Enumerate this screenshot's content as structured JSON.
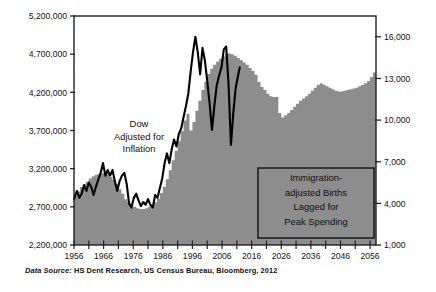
{
  "figure": {
    "background": "#ffffff",
    "plot_background": "#ffffff",
    "frame_color": "#222222",
    "area_color": "#8d8d8d",
    "line_color": "#000000"
  },
  "source": {
    "lead": "Data Source:",
    "text": " HS Dent Research, US Census Bureau, Bloomberg, 2012"
  },
  "annotations": {
    "dow": {
      "lines": [
        "Dow",
        "Adjusted for",
        "Inflation"
      ],
      "x": 139,
      "y": 127
    },
    "births": {
      "lines": [
        "Immigration-",
        "adjusted Births",
        "Lagged for",
        "Peak Spending"
      ],
      "x": 316,
      "y": 181,
      "box": {
        "x": 258,
        "y": 168,
        "width": 116,
        "height": 70
      }
    }
  },
  "chart_data": {
    "type": "area",
    "title": "",
    "xlabel": "",
    "ylabel": "",
    "grid": false,
    "legend": "none",
    "xlim": [
      1956,
      2058
    ],
    "x_ticks": [
      1956,
      1966,
      1976,
      1986,
      1996,
      2006,
      2016,
      2026,
      2036,
      2046,
      2056
    ],
    "x_minor_step": 5,
    "left_axis": {
      "name": "Immigration-adjusted Births Lagged for Peak Spending",
      "ylim": [
        2200000,
        5200000
      ],
      "ticks": [
        2200000,
        2700000,
        3200000,
        3700000,
        4200000,
        4700000,
        5200000
      ],
      "tick_labels": [
        "2,200,000",
        "2,700,000",
        "3,200,000",
        "3,700,000",
        "4,200,000",
        "4,700,000",
        "5,200,000"
      ]
    },
    "right_axis": {
      "name": "Dow Adjusted for Inflation",
      "ylim": [
        1000,
        17500
      ],
      "ticks": [
        1000,
        4000,
        7000,
        10000,
        13000,
        16000
      ],
      "tick_labels": [
        "1,000",
        "4,000",
        "7,000",
        "10,000",
        "13,000",
        "16,000"
      ]
    },
    "series": [
      {
        "name": "Immigration-adjusted Births Lagged for Peak Spending",
        "type": "area",
        "axis": "left",
        "color": "#8d8d8d",
        "x": [
          1956,
          1957,
          1958,
          1959,
          1960,
          1961,
          1962,
          1963,
          1964,
          1965,
          1966,
          1967,
          1968,
          1969,
          1970,
          1971,
          1972,
          1973,
          1974,
          1975,
          1976,
          1977,
          1978,
          1979,
          1980,
          1981,
          1982,
          1983,
          1984,
          1985,
          1986,
          1987,
          1988,
          1989,
          1990,
          1991,
          1992,
          1993,
          1994,
          1995,
          1996,
          1997,
          1998,
          1999,
          2000,
          2001,
          2002,
          2003,
          2004,
          2005,
          2006,
          2007,
          2008,
          2009,
          2010,
          2011,
          2012,
          2013,
          2014,
          2015,
          2016,
          2017,
          2018,
          2019,
          2020,
          2021,
          2022,
          2023,
          2024,
          2025,
          2026,
          2027,
          2028,
          2029,
          2030,
          2031,
          2032,
          2033,
          2034,
          2035,
          2036,
          2037,
          2038,
          2039,
          2040,
          2041,
          2042,
          2043,
          2044,
          2045,
          2046,
          2047,
          2048,
          2049,
          2050,
          2051,
          2052,
          2053,
          2054,
          2055,
          2056,
          2057
        ],
        "values": [
          2840000,
          2900000,
          2960000,
          3000000,
          3030000,
          3070000,
          3100000,
          3120000,
          3130000,
          3140000,
          3150000,
          3130000,
          3090000,
          3050000,
          3000000,
          2930000,
          2870000,
          2800000,
          2760000,
          2720000,
          2700000,
          2680000,
          2670000,
          2670000,
          2680000,
          2700000,
          2720000,
          2760000,
          2810000,
          2880000,
          2960000,
          3060000,
          3180000,
          3310000,
          3430000,
          3560000,
          3690000,
          3830000,
          3920000,
          3700000,
          3810000,
          3960000,
          4090000,
          4230000,
          4340000,
          4440000,
          4510000,
          4560000,
          4600000,
          4640000,
          4670000,
          4700000,
          4710000,
          4700000,
          4680000,
          4650000,
          4620000,
          4590000,
          4560000,
          4520000,
          4480000,
          4430000,
          4340000,
          4270000,
          4230000,
          4180000,
          4150000,
          4140000,
          4140000,
          3930000,
          3870000,
          3900000,
          3930000,
          3970000,
          4010000,
          4050000,
          4090000,
          4120000,
          4150000,
          4180000,
          4220000,
          4260000,
          4300000,
          4320000,
          4300000,
          4280000,
          4260000,
          4240000,
          4220000,
          4210000,
          4210000,
          4220000,
          4230000,
          4240000,
          4250000,
          4260000,
          4280000,
          4300000,
          4320000,
          4350000,
          4400000,
          4460000
        ]
      },
      {
        "name": "Dow Adjusted for Inflation",
        "type": "line",
        "axis": "right",
        "color": "#000000",
        "x": [
          1956.0,
          1957.0,
          1957.8,
          1958.6,
          1959.4,
          1960.2,
          1961.0,
          1961.8,
          1962.6,
          1963.4,
          1964.2,
          1965.0,
          1965.8,
          1966.6,
          1967.4,
          1968.2,
          1969.0,
          1969.8,
          1970.6,
          1971.4,
          1972.2,
          1973.0,
          1973.8,
          1974.6,
          1975.4,
          1976.2,
          1977.0,
          1977.8,
          1978.6,
          1979.4,
          1980.2,
          1981.0,
          1981.8,
          1982.6,
          1983.4,
          1984.2,
          1985.0,
          1985.8,
          1986.6,
          1987.4,
          1988.2,
          1989.0,
          1989.8,
          1990.6,
          1991.4,
          1992.2,
          1993.0,
          1993.8,
          1994.6,
          1995.4,
          1996.2,
          1997.0,
          1997.8,
          1998.6,
          1999.4,
          2000.2,
          2001.0,
          2001.8,
          2002.6,
          2003.4,
          2004.2,
          2005.0,
          2005.8,
          2006.6,
          2007.4,
          2008.2,
          2009.0,
          2009.8,
          2010.6,
          2011.4,
          2012.0
        ],
        "values": [
          4300,
          4900,
          4400,
          4700,
          5300,
          4900,
          5500,
          5200,
          4600,
          5200,
          5700,
          6200,
          6900,
          6000,
          6400,
          6000,
          6400,
          5600,
          4900,
          5600,
          6000,
          6200,
          5400,
          4000,
          3700,
          4400,
          4700,
          4200,
          3800,
          4100,
          3900,
          4300,
          3900,
          3700,
          4600,
          4400,
          5100,
          5800,
          6900,
          7600,
          6900,
          7900,
          8600,
          8100,
          9000,
          9400,
          10200,
          11000,
          11900,
          13500,
          14900,
          16000,
          14900,
          13300,
          15200,
          14300,
          12800,
          11200,
          9300,
          11000,
          12500,
          13200,
          13800,
          15100,
          15300,
          12600,
          8200,
          10500,
          12300,
          13200,
          13800
        ]
      }
    ]
  }
}
